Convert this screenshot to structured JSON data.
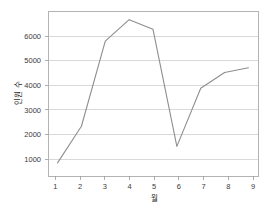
{
  "chart_data": {
    "type": "line",
    "title": "",
    "subtitle": "",
    "xlabel": "월",
    "ylabel": "인원 수",
    "x": [
      1,
      2,
      3,
      4,
      5,
      6,
      7,
      8,
      9
    ],
    "categories": [
      "1",
      "2",
      "3",
      "4",
      "5",
      "6",
      "7",
      "8",
      "9"
    ],
    "values": [
      950,
      2350,
      5600,
      6420,
      6050,
      1580,
      3800,
      4400,
      4580
    ],
    "series": [
      {
        "name": "인원 수",
        "values": [
          950,
          2350,
          5600,
          6420,
          6050,
          1580,
          3800,
          4400,
          4580
        ]
      }
    ],
    "xlim": [
      0.6,
      9.4
    ],
    "ylim": [
      450,
      6750
    ],
    "xticks": [
      1,
      2,
      3,
      4,
      5,
      6,
      7,
      8,
      9
    ],
    "xtick_labels": [
      "1",
      "2",
      "3",
      "4",
      "5",
      "6",
      "7",
      "8",
      "9"
    ],
    "yticks": [
      1000,
      2000,
      3000,
      4000,
      5000,
      6000
    ],
    "ytick_labels": [
      "1000",
      "2000",
      "3000",
      "4000",
      "5000",
      "6000"
    ],
    "grid": "horizontal",
    "legend": "none",
    "line_color": "#8e8e8e",
    "grid_color": "#d0d0d0",
    "frame_color": "#b3b3b3",
    "background_color": "#ffffff",
    "annotations": []
  }
}
